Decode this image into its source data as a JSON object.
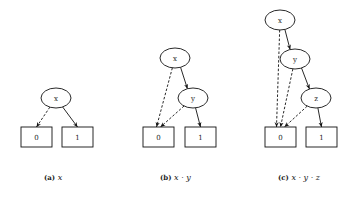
{
  "figure": {
    "subfigures": [
      {
        "id": "a",
        "caption_tag": "(a)",
        "caption_expr": "x",
        "nodes": [
          {
            "id": "x",
            "label": "x",
            "shape": "ellipse",
            "cx": 56,
            "cy": 98
          },
          {
            "id": "0",
            "label": "0",
            "shape": "box",
            "x": 21,
            "y": 127
          },
          {
            "id": "1",
            "label": "1",
            "shape": "box",
            "x": 62,
            "y": 127
          }
        ],
        "edges": [
          {
            "from": "x",
            "to": "0",
            "style": "dashed"
          },
          {
            "from": "x",
            "to": "1",
            "style": "solid"
          }
        ]
      },
      {
        "id": "b",
        "caption_tag": "(b)",
        "caption_expr": "x · y",
        "nodes": [
          {
            "id": "x",
            "label": "x",
            "shape": "ellipse",
            "cx": 175,
            "cy": 58
          },
          {
            "id": "y",
            "label": "y",
            "shape": "ellipse",
            "cx": 193,
            "cy": 98
          },
          {
            "id": "0",
            "label": "0",
            "shape": "box",
            "x": 143,
            "y": 127
          },
          {
            "id": "1",
            "label": "1",
            "shape": "box",
            "x": 185,
            "y": 127
          }
        ],
        "edges": [
          {
            "from": "x",
            "to": "0",
            "style": "dashed"
          },
          {
            "from": "x",
            "to": "y",
            "style": "solid"
          },
          {
            "from": "y",
            "to": "0",
            "style": "dashed"
          },
          {
            "from": "y",
            "to": "1",
            "style": "solid"
          }
        ]
      },
      {
        "id": "c",
        "caption_tag": "(c)",
        "caption_expr": "x · y · z",
        "nodes": [
          {
            "id": "x",
            "label": "x",
            "shape": "ellipse",
            "cx": 280,
            "cy": 20
          },
          {
            "id": "y",
            "label": "y",
            "shape": "ellipse",
            "cx": 295,
            "cy": 59
          },
          {
            "id": "z",
            "label": "z",
            "shape": "ellipse",
            "cx": 316,
            "cy": 98
          },
          {
            "id": "0",
            "label": "0",
            "shape": "box",
            "x": 265,
            "y": 127
          },
          {
            "id": "1",
            "label": "1",
            "shape": "box",
            "x": 306,
            "y": 127
          }
        ],
        "edges": [
          {
            "from": "x",
            "to": "0",
            "style": "dashed"
          },
          {
            "from": "x",
            "to": "y",
            "style": "solid"
          },
          {
            "from": "y",
            "to": "0",
            "style": "dashed"
          },
          {
            "from": "y",
            "to": "z",
            "style": "solid"
          },
          {
            "from": "z",
            "to": "0",
            "style": "dashed"
          },
          {
            "from": "z",
            "to": "1",
            "style": "solid"
          }
        ]
      }
    ]
  },
  "captions": {
    "a": {
      "tag": "(a)",
      "expr": "x"
    },
    "b": {
      "tag": "(b)",
      "expr": "x · y"
    },
    "c": {
      "tag": "(c)",
      "expr": "x · y · z"
    }
  }
}
